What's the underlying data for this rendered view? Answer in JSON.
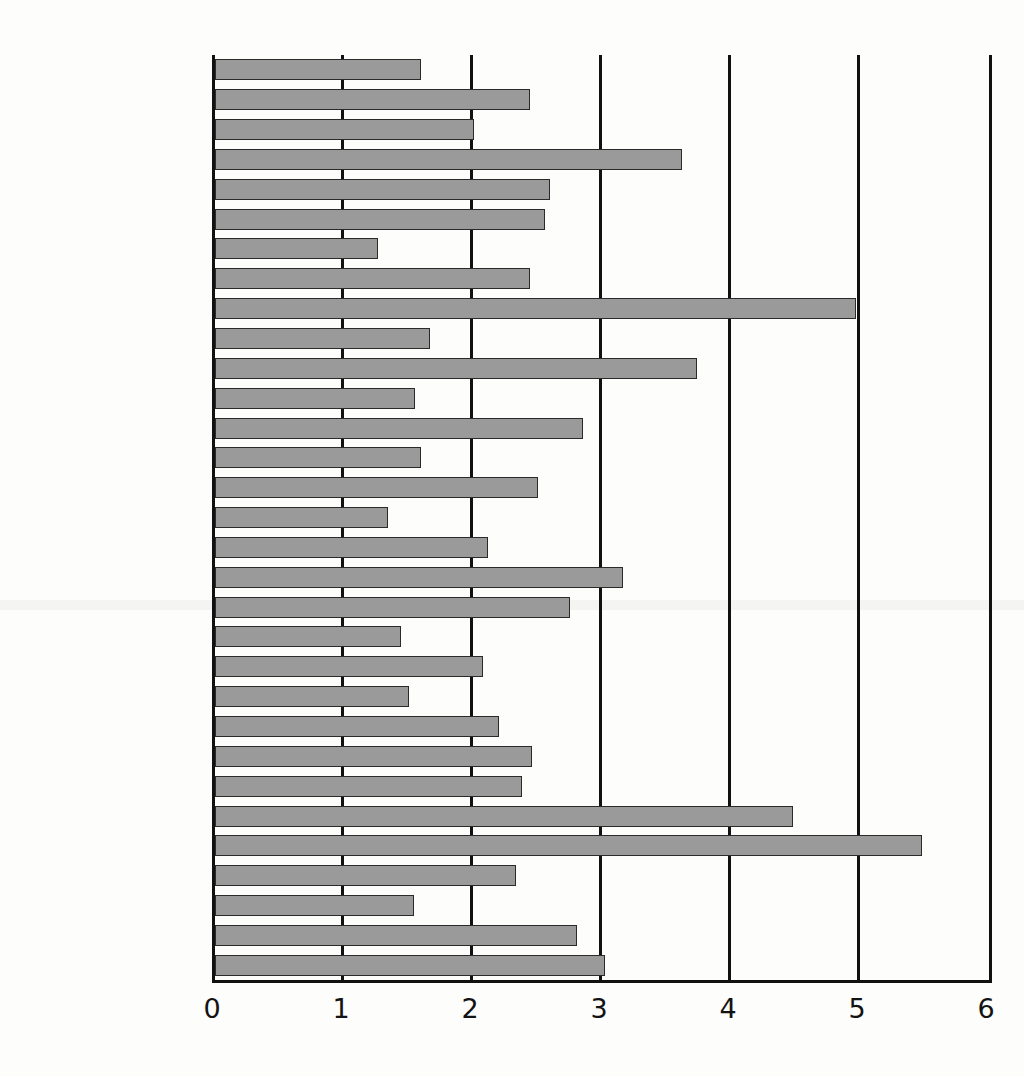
{
  "chart_data": {
    "type": "bar",
    "orientation": "horizontal",
    "title": "",
    "subtitle": "",
    "xlabel": "",
    "ylabel": "",
    "xlim": [
      0,
      6
    ],
    "ylim": null,
    "grid": true,
    "legend": null,
    "xticks": [
      "0",
      "1",
      "2",
      "3",
      "4",
      "5",
      "6"
    ],
    "xtick_values": [
      0,
      1,
      2,
      3,
      4,
      5,
      6
    ],
    "categories": [
      "Argentina",
      "Australia",
      "Brazil",
      "Britain",
      "Canada",
      "Chile",
      "China",
      "Czech Republic",
      "Denmark",
      "Egypt",
      "Euro area",
      "Hong Kong",
      "Hungary",
      "Indonesia",
      "Japan",
      "Malaysia",
      "Mexico",
      "New Zealand",
      "Peru",
      "Philippines",
      "Poland",
      "Russia",
      "Singapore",
      "South Africa",
      "South Korea",
      "Sweden",
      "Switzerland",
      "Taiwan",
      "Thailand",
      "Turkey",
      "United States"
    ],
    "values": [
      1.6,
      2.44,
      2.01,
      3.62,
      2.6,
      2.56,
      1.26,
      2.44,
      4.97,
      1.67,
      3.74,
      1.55,
      2.85,
      1.6,
      2.5,
      1.34,
      2.12,
      3.16,
      2.75,
      1.44,
      2.08,
      1.5,
      2.2,
      2.46,
      2.38,
      4.48,
      5.48,
      2.33,
      1.54,
      2.81,
      3.02
    ],
    "colors": {
      "bar_fill": "#9a9a9a",
      "bar_edge": "#2a2a2a",
      "axis": "#111111",
      "background": "#fdfdfb",
      "text": "#161616"
    }
  }
}
